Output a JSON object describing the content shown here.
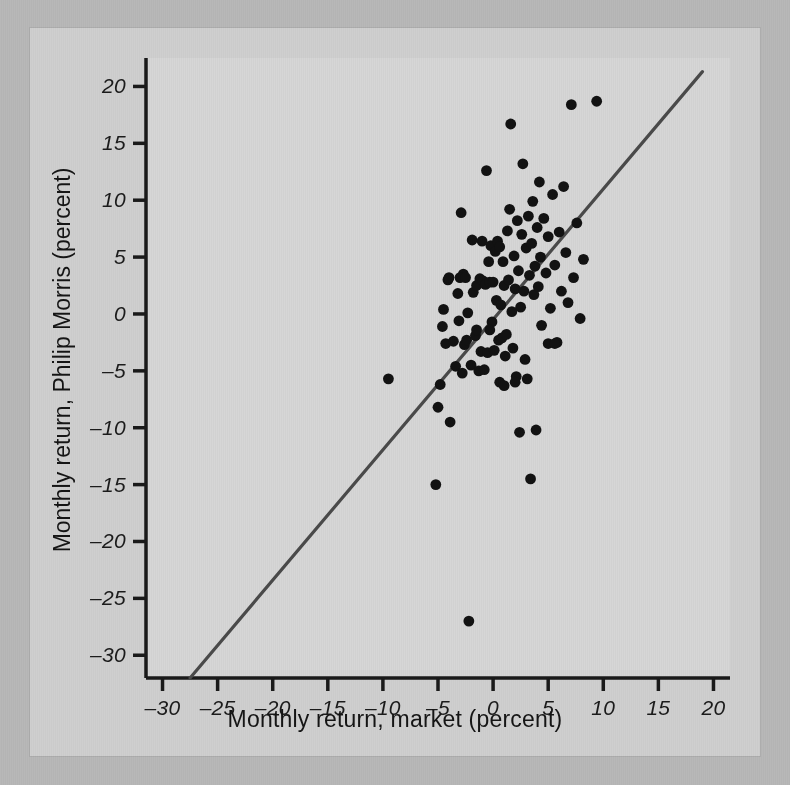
{
  "figure": {
    "background_color": "#cfcfcf",
    "plot_background_color": "#d6d6d6",
    "axis_color": "#1a1a1a",
    "point_color": "#121212",
    "line_color": "#4a4a4a"
  },
  "chart_data": {
    "type": "scatter",
    "title": "",
    "xlabel": "Monthly return, market (percent)",
    "ylabel": "Monthly return, Philip Morris (percent)",
    "xlim": [
      -31.5,
      21.5
    ],
    "ylim": [
      -32.0,
      22.5
    ],
    "xticks": [
      -30,
      -25,
      -20,
      -15,
      -10,
      -5,
      0,
      5,
      10,
      15,
      20
    ],
    "yticks": [
      20,
      15,
      10,
      5,
      0,
      -5,
      -10,
      -15,
      -20,
      -25,
      -30
    ],
    "xtick_labels": [
      "-30",
      "-25",
      "-20",
      "-15",
      "-10",
      "-5",
      "0",
      "5",
      "10",
      "15",
      "20"
    ],
    "ytick_labels": [
      "20",
      "15",
      "10",
      "5",
      "0",
      "-5",
      "-10",
      "-15",
      "-20",
      "-25",
      "-30"
    ],
    "grid": false,
    "legend": null,
    "fit_line": {
      "label": "regression line",
      "x_start": -27.5,
      "y_start": -32.0,
      "x_end": 19.0,
      "y_end": 21.3,
      "slope": 1.146,
      "intercept": -0.48
    },
    "series": [
      {
        "name": "Monthly returns",
        "marker": "circle",
        "points": [
          [
            -9.5,
            -5.7
          ],
          [
            -5.2,
            -15.0
          ],
          [
            -5.0,
            -8.2
          ],
          [
            -4.8,
            -6.2
          ],
          [
            -4.6,
            -1.1
          ],
          [
            -4.5,
            0.4
          ],
          [
            -4.3,
            -2.6
          ],
          [
            -4.1,
            3.0
          ],
          [
            -3.9,
            -9.5
          ],
          [
            -3.6,
            -2.4
          ],
          [
            -3.4,
            -4.6
          ],
          [
            -3.2,
            1.8
          ],
          [
            -3.1,
            -0.6
          ],
          [
            -2.9,
            8.9
          ],
          [
            -2.8,
            -5.2
          ],
          [
            -2.7,
            3.5
          ],
          [
            -2.6,
            -2.7
          ],
          [
            -2.4,
            -2.3
          ],
          [
            -2.3,
            0.1
          ],
          [
            -2.2,
            -27.0
          ],
          [
            -2.0,
            -4.5
          ],
          [
            -1.9,
            6.5
          ],
          [
            -1.8,
            1.9
          ],
          [
            -1.6,
            -1.9
          ],
          [
            -1.5,
            2.5
          ],
          [
            -1.3,
            -5.0
          ],
          [
            -1.2,
            3.1
          ],
          [
            -1.1,
            -3.3
          ],
          [
            -1.0,
            6.4
          ],
          [
            -0.9,
            2.9
          ],
          [
            -0.8,
            -4.9
          ],
          [
            -0.7,
            2.6
          ],
          [
            -0.6,
            12.6
          ],
          [
            -0.5,
            -3.4
          ],
          [
            -0.4,
            4.6
          ],
          [
            -0.3,
            2.8
          ],
          [
            -0.2,
            6.0
          ],
          [
            -0.1,
            -0.7
          ],
          [
            0.0,
            2.8
          ],
          [
            0.1,
            -3.2
          ],
          [
            0.2,
            5.5
          ],
          [
            0.3,
            1.2
          ],
          [
            0.4,
            6.4
          ],
          [
            0.5,
            -2.3
          ],
          [
            0.6,
            5.9
          ],
          [
            0.7,
            0.8
          ],
          [
            0.8,
            -2.1
          ],
          [
            0.9,
            4.6
          ],
          [
            1.0,
            2.5
          ],
          [
            1.1,
            -3.7
          ],
          [
            1.2,
            -1.8
          ],
          [
            1.3,
            7.3
          ],
          [
            1.4,
            3.0
          ],
          [
            1.5,
            9.2
          ],
          [
            1.6,
            16.7
          ],
          [
            1.7,
            0.2
          ],
          [
            1.8,
            -3.0
          ],
          [
            1.9,
            5.1
          ],
          [
            2.0,
            2.2
          ],
          [
            2.1,
            -5.5
          ],
          [
            2.2,
            8.2
          ],
          [
            2.3,
            3.8
          ],
          [
            2.4,
            -10.4
          ],
          [
            2.5,
            0.6
          ],
          [
            2.6,
            7.0
          ],
          [
            2.7,
            13.2
          ],
          [
            2.8,
            2.0
          ],
          [
            2.9,
            -4.0
          ],
          [
            3.0,
            5.8
          ],
          [
            3.1,
            -5.7
          ],
          [
            3.2,
            8.6
          ],
          [
            3.3,
            3.4
          ],
          [
            3.4,
            -14.5
          ],
          [
            3.5,
            6.2
          ],
          [
            3.6,
            9.9
          ],
          [
            3.7,
            1.7
          ],
          [
            3.8,
            4.2
          ],
          [
            3.9,
            -10.2
          ],
          [
            4.0,
            7.6
          ],
          [
            4.1,
            2.4
          ],
          [
            4.2,
            11.6
          ],
          [
            4.3,
            5.0
          ],
          [
            4.4,
            -1.0
          ],
          [
            4.6,
            8.4
          ],
          [
            4.8,
            3.6
          ],
          [
            5.0,
            6.8
          ],
          [
            5.2,
            0.5
          ],
          [
            5.4,
            10.5
          ],
          [
            5.6,
            4.3
          ],
          [
            5.8,
            -2.5
          ],
          [
            6.0,
            7.2
          ],
          [
            6.2,
            2.0
          ],
          [
            6.4,
            11.2
          ],
          [
            6.6,
            5.4
          ],
          [
            6.8,
            1.0
          ],
          [
            7.1,
            18.4
          ],
          [
            7.3,
            3.2
          ],
          [
            7.6,
            8.0
          ],
          [
            7.9,
            -0.4
          ],
          [
            8.2,
            4.8
          ],
          [
            9.4,
            18.7
          ],
          [
            -4.0,
            3.2
          ],
          [
            -3.0,
            3.2
          ],
          [
            -2.5,
            3.2
          ],
          [
            0.6,
            -6.0
          ],
          [
            1.0,
            -6.3
          ],
          [
            2.0,
            -6.0
          ],
          [
            -1.5,
            -1.4
          ],
          [
            -0.3,
            -1.4
          ],
          [
            5.0,
            -2.6
          ],
          [
            5.6,
            -2.6
          ]
        ]
      }
    ]
  }
}
